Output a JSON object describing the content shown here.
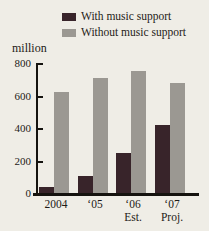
{
  "chart_data": {
    "type": "bar",
    "title": "",
    "ylabel": "million",
    "xlabel": "",
    "ylim": [
      0,
      800
    ],
    "yticks": [
      800,
      600,
      400,
      200,
      0
    ],
    "grid": false,
    "legend_position": "top",
    "categories": [
      {
        "label": "2004",
        "sublabel": ""
      },
      {
        "label": "‘05",
        "sublabel": ""
      },
      {
        "label": "‘06",
        "sublabel": "Est."
      },
      {
        "label": "‘07",
        "sublabel": "Proj."
      }
    ],
    "series": [
      {
        "name": "With music support",
        "color": "#38242a",
        "values": [
          40,
          105,
          245,
          420
        ]
      },
      {
        "name": "Without music support",
        "color": "#9b9892",
        "values": [
          620,
          710,
          750,
          680
        ]
      }
    ]
  },
  "colors": {
    "background": "#efede6",
    "axis": "#15130f",
    "text": "#1e1b17"
  }
}
